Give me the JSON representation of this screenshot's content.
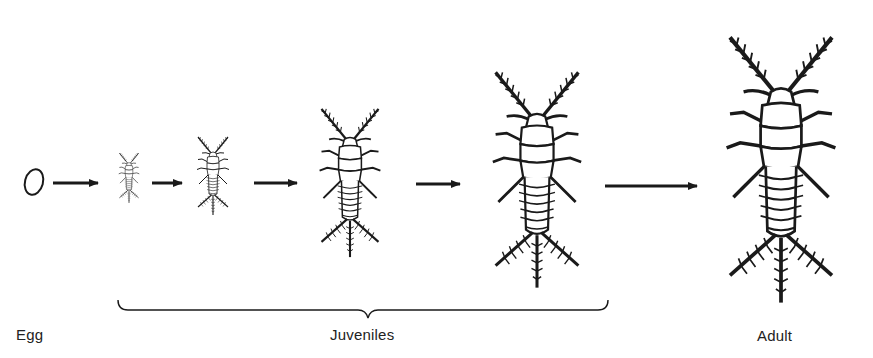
{
  "diagram": {
    "type": "life-cycle",
    "stages": [
      {
        "id": "egg",
        "label": "Egg"
      },
      {
        "id": "juvenile-1",
        "group": "Juveniles"
      },
      {
        "id": "juvenile-2",
        "group": "Juveniles"
      },
      {
        "id": "juvenile-3",
        "group": "Juveniles"
      },
      {
        "id": "juvenile-4",
        "group": "Juveniles"
      },
      {
        "id": "adult",
        "label": "Adult"
      }
    ],
    "labels": {
      "egg": "Egg",
      "juveniles": "Juveniles",
      "adult": "Adult"
    },
    "arrows": 5,
    "colors": {
      "ink": "#1a1a1a",
      "background": "#ffffff"
    }
  }
}
